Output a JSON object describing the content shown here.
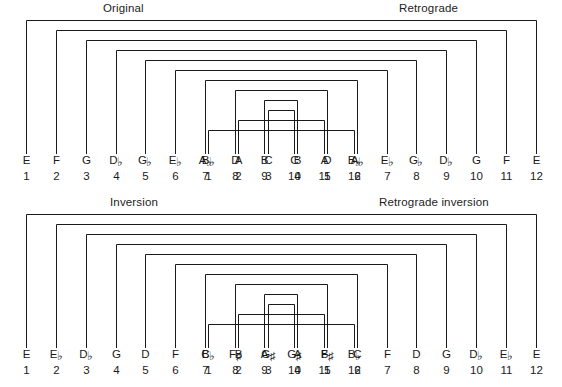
{
  "figure": {
    "width": 562,
    "height": 387,
    "line_color": "#1a1a1a",
    "background": "#ffffff"
  },
  "panels": [
    {
      "id": "original",
      "title_left": "Original",
      "title_right": "Retrograde",
      "left_row": [
        {
          "note": "E",
          "acc": "",
          "num": "1"
        },
        {
          "note": "F",
          "acc": "",
          "num": "2"
        },
        {
          "note": "G",
          "acc": "",
          "num": "3"
        },
        {
          "note": "D",
          "acc": "♭",
          "num": "4"
        },
        {
          "note": "G",
          "acc": "♭",
          "num": "5"
        },
        {
          "note": "E",
          "acc": "♭",
          "num": "6"
        },
        {
          "note": "A",
          "acc": "♭",
          "num": "7"
        },
        {
          "note": "D",
          "acc": "",
          "num": "8"
        },
        {
          "note": "B",
          "acc": "",
          "num": "9"
        },
        {
          "note": "C",
          "acc": "",
          "num": "10"
        },
        {
          "note": "A",
          "acc": "",
          "num": "11"
        },
        {
          "note": "B",
          "acc": "♭",
          "num": "12"
        }
      ],
      "right_row": [
        {
          "note": "B",
          "acc": "♭",
          "num": "1"
        },
        {
          "note": "A",
          "acc": "",
          "num": "2"
        },
        {
          "note": "C",
          "acc": "",
          "num": "3"
        },
        {
          "note": "B",
          "acc": "",
          "num": "4"
        },
        {
          "note": "D",
          "acc": "",
          "num": "5"
        },
        {
          "note": "A",
          "acc": "♭",
          "num": "6"
        },
        {
          "note": "E",
          "acc": "♭",
          "num": "7"
        },
        {
          "note": "G",
          "acc": "♭",
          "num": "8"
        },
        {
          "note": "D",
          "acc": "♭",
          "num": "9"
        },
        {
          "note": "G",
          "acc": "",
          "num": "10"
        },
        {
          "note": "F",
          "acc": "",
          "num": "11"
        },
        {
          "note": "E",
          "acc": "",
          "num": "12"
        }
      ]
    },
    {
      "id": "inversion",
      "title_left": "Inversion",
      "title_right": "Retrograde inversion",
      "left_row": [
        {
          "note": "E",
          "acc": "",
          "num": "1"
        },
        {
          "note": "E",
          "acc": "♭",
          "num": "2"
        },
        {
          "note": "D",
          "acc": "♭",
          "num": "3"
        },
        {
          "note": "G",
          "acc": "",
          "num": "4"
        },
        {
          "note": "D",
          "acc": "",
          "num": "5"
        },
        {
          "note": "F",
          "acc": "",
          "num": "6"
        },
        {
          "note": "C",
          "acc": "",
          "num": "7"
        },
        {
          "note": "F",
          "acc": "♯",
          "num": "8"
        },
        {
          "note": "A",
          "acc": "",
          "num": "9"
        },
        {
          "note": "G",
          "acc": "♯",
          "num": "10"
        },
        {
          "note": "B",
          "acc": "",
          "num": "11"
        },
        {
          "note": "B",
          "acc": "♭",
          "num": "12"
        }
      ],
      "right_row": [
        {
          "note": "B",
          "acc": "♭",
          "num": "1"
        },
        {
          "note": "B",
          "acc": "",
          "num": "2"
        },
        {
          "note": "G",
          "acc": "♯",
          "num": "3"
        },
        {
          "note": "A",
          "acc": "",
          "num": "4"
        },
        {
          "note": "F",
          "acc": "♯",
          "num": "5"
        },
        {
          "note": "C",
          "acc": "",
          "num": "6"
        },
        {
          "note": "F",
          "acc": "",
          "num": "7"
        },
        {
          "note": "D",
          "acc": "",
          "num": "8"
        },
        {
          "note": "G",
          "acc": "",
          "num": "9"
        },
        {
          "note": "D",
          "acc": "♭",
          "num": "10"
        },
        {
          "note": "E",
          "acc": "♭",
          "num": "11"
        },
        {
          "note": "E",
          "acc": "",
          "num": "12"
        }
      ]
    }
  ],
  "geometry": {
    "left_x": [
      26,
      56,
      86,
      116,
      145,
      175,
      205,
      235,
      264,
      294,
      324,
      354
    ],
    "right_x": [
      208,
      238,
      268,
      297,
      327,
      357,
      387,
      416,
      446,
      476,
      506,
      536
    ],
    "bracket_tops": [
      2,
      12,
      22,
      32,
      42,
      52,
      62,
      72,
      82,
      92,
      102,
      112
    ],
    "bracket_bottom": 128
  }
}
